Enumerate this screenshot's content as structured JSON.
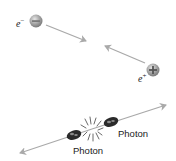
{
  "diagram": {
    "colors": {
      "arrow": "#a9a9a9",
      "particle_fill": "#9a9a9a",
      "particle_highlight": "#d8d8d8",
      "photon_blob": "#2a2a2a",
      "text": "#222222"
    },
    "electron": {
      "label": "e",
      "charge_sup": "−",
      "sign": "−"
    },
    "positron": {
      "label": "e",
      "charge_sup": "+",
      "sign": "+"
    },
    "photons": [
      {
        "label": "Photon"
      },
      {
        "label": "Photon"
      }
    ]
  }
}
